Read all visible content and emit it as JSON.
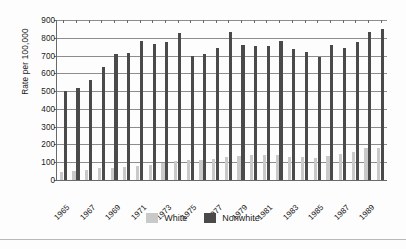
{
  "chart_data": {
    "type": "bar",
    "title": "",
    "xlabel": "",
    "ylabel": "Rate per 100,000",
    "ylim": [
      0,
      900
    ],
    "yticks": [
      0,
      100,
      200,
      300,
      400,
      500,
      600,
      700,
      800,
      900
    ],
    "grid": true,
    "legend_position": "bottom",
    "categories": [
      "1965",
      "1966",
      "1967",
      "1968",
      "1969",
      "1970",
      "1971",
      "1972",
      "1973",
      "1974",
      "1975",
      "1976",
      "1977",
      "1978",
      "1979",
      "1980",
      "1981",
      "1982",
      "1983",
      "1984",
      "1985",
      "1986",
      "1987",
      "1988",
      "1989",
      "1990"
    ],
    "tick_labels": [
      "1965",
      "",
      "1967",
      "",
      "1969",
      "",
      "1971",
      "",
      "1973",
      "",
      "1975",
      "",
      "1977",
      "",
      "1979",
      "",
      "1981",
      "",
      "1983",
      "",
      "1985",
      "",
      "1987",
      "",
      "1989",
      ""
    ],
    "series": [
      {
        "name": "White",
        "color": "#c9c9c9",
        "values": [
          47,
          52,
          58,
          67,
          70,
          76,
          80,
          84,
          96,
          105,
          115,
          110,
          119,
          127,
          133,
          140,
          142,
          143,
          132,
          127,
          125,
          137,
          146,
          155,
          181,
          181
        ]
      },
      {
        "name": "Nonwhite",
        "color": "#4a4a4a",
        "values": [
          500,
          517,
          564,
          634,
          711,
          715,
          781,
          763,
          777,
          826,
          697,
          707,
          745,
          832,
          759,
          752,
          752,
          783,
          737,
          718,
          690,
          759,
          742,
          775,
          835,
          848
        ]
      }
    ]
  },
  "legend": {
    "items": [
      {
        "label": "White",
        "color": "#c9c9c9"
      },
      {
        "label": "Nonwhite",
        "color": "#4a4a4a"
      }
    ]
  },
  "axis": {
    "y_title": "Rate per 100,000"
  }
}
